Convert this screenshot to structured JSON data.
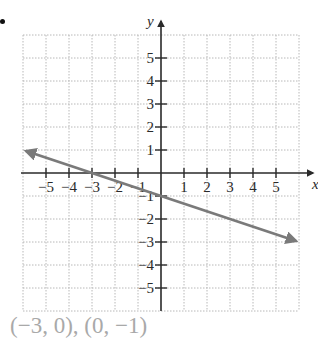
{
  "chart_data": {
    "type": "line",
    "title": "",
    "xlabel": "x",
    "ylabel": "y",
    "xlim": [
      -6,
      6
    ],
    "ylim": [
      -6,
      6
    ],
    "grid": true,
    "x_ticks": [
      -5,
      -4,
      -3,
      -2,
      -1,
      1,
      2,
      3,
      4,
      5
    ],
    "y_ticks": [
      -5,
      -4,
      -3,
      -2,
      -1,
      1,
      2,
      3,
      4,
      5
    ],
    "x_tick_labels": [
      "−5",
      "−4",
      "−3",
      "−2",
      "−1",
      "1",
      "2",
      "3",
      "4",
      "5"
    ],
    "y_tick_labels": [
      "−5",
      "−4",
      "−3",
      "−2",
      "−1",
      "1",
      "2",
      "3",
      "4",
      "5"
    ],
    "series": [
      {
        "name": "line",
        "equation": "y = -x/3 - 1",
        "x": [
          -6,
          -3,
          0,
          6
        ],
        "y": [
          1,
          0,
          -1,
          -3
        ],
        "arrows": "both",
        "color": "#7a7a7a"
      }
    ],
    "annotations": [
      "(−3, 0), (0, −1)"
    ]
  },
  "caption": "(−3, 0), (0, −1)",
  "colors": {
    "axis": "#2a2a2a",
    "grid": "#b8b8b8",
    "line": "#7a7a7a",
    "caption": "#a9a9a9"
  }
}
